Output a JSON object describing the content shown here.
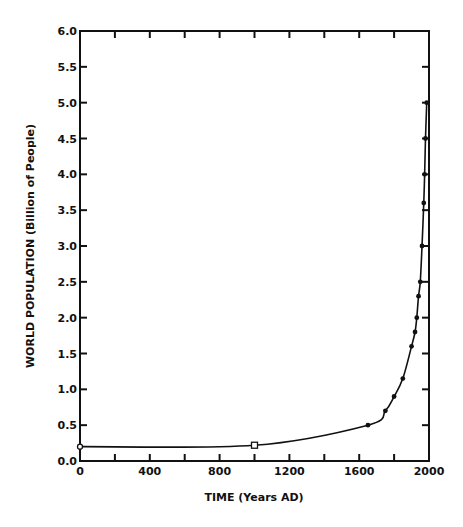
{
  "chart_data": {
    "type": "line",
    "title": "",
    "xlabel": "TIME (Years AD)",
    "ylabel": "WORLD POPULATION (Billion of People)",
    "xlim": [
      0,
      2000
    ],
    "ylim": [
      0.0,
      6.0
    ],
    "x_ticks": [
      0,
      400,
      800,
      1200,
      1600,
      2000
    ],
    "x_minor_ticks": [
      200,
      600,
      1000,
      1400,
      1800
    ],
    "x_tick_labels": [
      "0",
      "400",
      "800",
      "1200",
      "1600",
      "2000"
    ],
    "y_ticks": [
      0.0,
      0.5,
      1.0,
      1.5,
      2.0,
      2.5,
      3.0,
      3.5,
      4.0,
      4.5,
      5.0,
      5.5,
      6.0
    ],
    "y_tick_labels": [
      "0.0",
      "0.5",
      "1.0",
      "1.5",
      "2.0",
      "2.5",
      "3.0",
      "3.5",
      "4.0",
      "4.5",
      "5.0",
      "5.5",
      "6.0"
    ],
    "grid": false,
    "legend": null,
    "series": [
      {
        "name": "World population",
        "x": [
          0,
          1000,
          1650,
          1750,
          1800,
          1850,
          1900,
          1920,
          1930,
          1940,
          1950,
          1960,
          1970,
          1975,
          1980,
          1987
        ],
        "values": [
          0.2,
          0.22,
          0.5,
          0.7,
          0.9,
          1.15,
          1.6,
          1.8,
          2.0,
          2.3,
          2.5,
          3.0,
          3.6,
          4.0,
          4.5,
          5.0
        ],
        "markers": [
          "open-circle",
          "open-square",
          "dot",
          "dot",
          "dot",
          "dot",
          "dot",
          "dot",
          "dot",
          "dot",
          "dot",
          "dot",
          "dot",
          "dot",
          "dot",
          "dot"
        ]
      }
    ]
  },
  "colors": {
    "line": "#111111",
    "background": "#ffffff"
  }
}
